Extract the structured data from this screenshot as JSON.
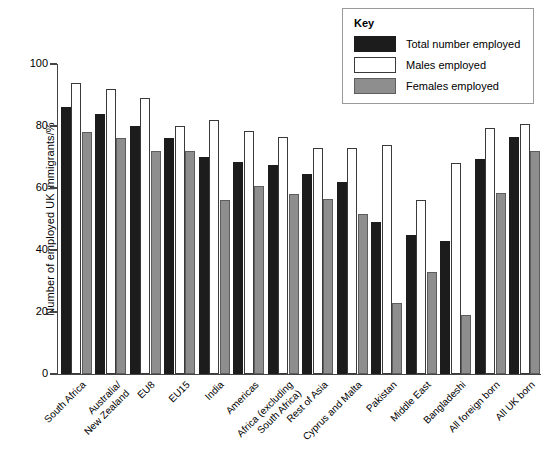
{
  "chart_data": {
    "type": "bar",
    "title": "",
    "xlabel": "",
    "ylabel": "Number of employed UK immigrants/%",
    "ylim": [
      0,
      100
    ],
    "yticks": [
      0,
      20,
      40,
      60,
      80,
      100
    ],
    "grid": false,
    "legend_position": "top-right",
    "legend_title": "Key",
    "categories": [
      "South Africa",
      "Australia/\nNew Zealand",
      "EU8",
      "EU15",
      "India",
      "Americas",
      "Africa (excluding\nSouth Africa)",
      "Rest of Asia",
      "Cyprus and Malta",
      "Pakistan",
      "Middle East",
      "Bangladeshi",
      "All foreign born",
      "All UK born"
    ],
    "series": [
      {
        "name": "Total number employed",
        "color": "#1c1c1c",
        "values": [
          86,
          84,
          80,
          76,
          70,
          68.5,
          67.5,
          64.5,
          62,
          49,
          45,
          43,
          69.5,
          76.5
        ]
      },
      {
        "name": "Males employed",
        "color": "#ffffff",
        "values": [
          94,
          92,
          89,
          80,
          82,
          78.5,
          76.5,
          73,
          73,
          74,
          56,
          68,
          79.5,
          80.5
        ]
      },
      {
        "name": "Females employed",
        "color": "#8e8e8e",
        "values": [
          78,
          76,
          72,
          72,
          56,
          60.5,
          58,
          56.5,
          51.5,
          23,
          33,
          19,
          58.5,
          72
        ]
      }
    ]
  },
  "axis": {
    "y_title": "Number of employed UK immigrants/%",
    "y_tick_labels": [
      "0",
      "20",
      "40",
      "60",
      "80",
      "100"
    ]
  },
  "legend": {
    "title": "Key",
    "items": [
      {
        "label": "Total number employed",
        "swatch": "total"
      },
      {
        "label": "Males employed",
        "swatch": "male"
      },
      {
        "label": "Females employed",
        "swatch": "female"
      }
    ]
  }
}
